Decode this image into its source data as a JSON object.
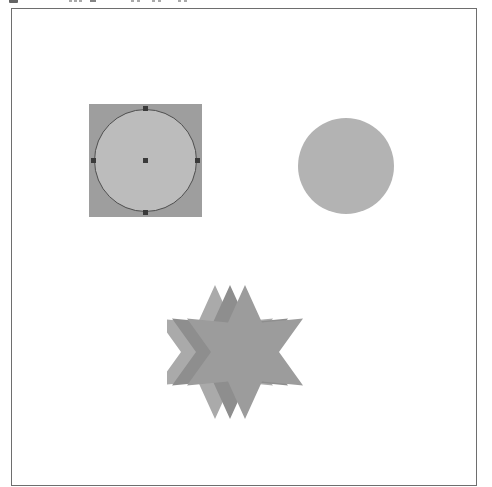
{
  "app": {
    "title": "Shape Canvas",
    "background_color": "#ffffff"
  },
  "toolbar": {
    "visible": "partially-cropped",
    "icons": [
      {
        "name": "tool-icon-1",
        "color": "#4a4a4a"
      },
      {
        "name": "tool-icon-2",
        "color": "#9a9a9a"
      },
      {
        "name": "tool-icon-3",
        "color": "#9a9a9a"
      },
      {
        "name": "tool-icon-4",
        "color": "#9a9a9a"
      },
      {
        "name": "tool-icon-5",
        "color": "#6f6f6f"
      },
      {
        "name": "tool-icon-6",
        "color": "#9a9a9a"
      },
      {
        "name": "tool-icon-7",
        "color": "#9a9a9a"
      },
      {
        "name": "tool-icon-8",
        "color": "#9a9a9a"
      },
      {
        "name": "tool-icon-9",
        "color": "#9a9a9a"
      },
      {
        "name": "tool-icon-10",
        "color": "#9a9a9a"
      },
      {
        "name": "tool-icon-11",
        "color": "#9a9a9a"
      }
    ]
  },
  "canvas": {
    "border_color": "#6e6e6e",
    "fill_color": "#ffffff",
    "shapes": [
      {
        "id": "selected-circle",
        "type": "ellipse",
        "state": "selected",
        "fill": "#bcbcbc",
        "stroke": "#4e4e4e",
        "selection_box_fill": "#9e9e9e",
        "handle_color": "#3a3a3a",
        "handle_count": 5,
        "x": 88,
        "y": 103,
        "width": 113,
        "height": 113
      },
      {
        "id": "plain-circle",
        "type": "ellipse",
        "state": "normal",
        "fill": "#b3b3b3",
        "stroke": "none",
        "x": 297,
        "y": 117,
        "width": 96,
        "height": 96
      },
      {
        "id": "star-back",
        "type": "star",
        "points": 6,
        "state": "normal",
        "fill": "#aaaaaa",
        "stroke": "none",
        "x": 166,
        "y": 273,
        "width": 135,
        "height": 135
      },
      {
        "id": "star-middle",
        "type": "star",
        "points": 6,
        "state": "normal",
        "fill": "#8e8e8e",
        "stroke": "none",
        "x": 181,
        "y": 273,
        "width": 135,
        "height": 135
      },
      {
        "id": "star-front",
        "type": "star",
        "points": 6,
        "state": "normal",
        "fill": "#9c9c9c",
        "stroke": "none",
        "x": 196,
        "y": 273,
        "width": 135,
        "height": 135
      }
    ]
  },
  "star_geometry": {
    "outer_radius": 67,
    "inner_radius": 34,
    "center_y": 78,
    "rotation_deg": -90,
    "centers_x": [
      48,
      63,
      78
    ]
  }
}
